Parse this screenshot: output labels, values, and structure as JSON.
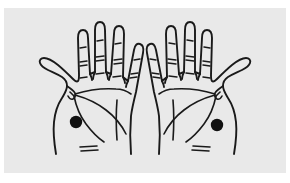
{
  "figure": {
    "background_color": "#e9e9e9",
    "plate_border_color": "#ffffff",
    "ink_color": "#1a1a1a",
    "marker_color": "#111111",
    "hands": [
      {
        "id": "left-hand",
        "label": "Left hand, palm facing viewer",
        "thumb_side": "left",
        "finger_count": 5,
        "marker": {
          "label": "marked point",
          "shape": "filled-circle",
          "cx": 72,
          "cy": 114,
          "r": 6.2
        }
      },
      {
        "id": "right-hand",
        "label": "Right hand, palm facing viewer",
        "thumb_side": "right",
        "finger_count": 5,
        "marker": {
          "label": "marked point",
          "shape": "filled-circle",
          "cx": 182,
          "cy": 117,
          "r": 6.2
        }
      }
    ],
    "annotations": {
      "finger_creases": "short horizontal dashes at each finger joint",
      "palm_lines": "heart line, head line, life line",
      "wrist_creases": "two short parallel dashes at wrist"
    }
  }
}
